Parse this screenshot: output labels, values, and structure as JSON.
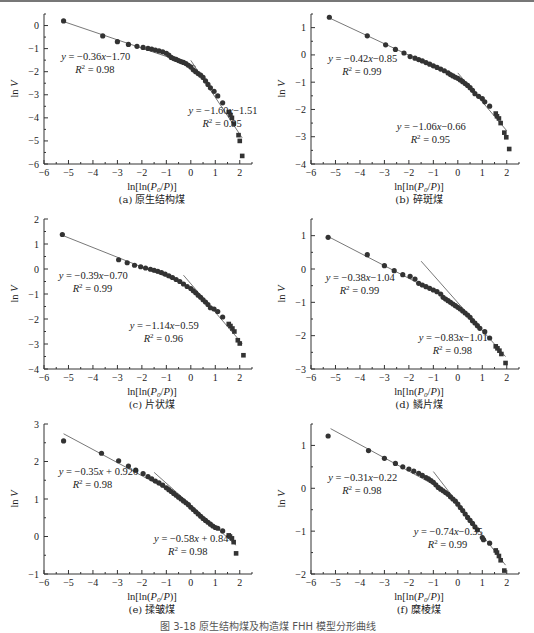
{
  "figure_caption": "图 3-18  原生结构煤及构造煤 FHH 模型分形曲线",
  "chart_data": [
    {
      "id": "a",
      "type": "scatter",
      "caption": "(a) 原生结构煤",
      "xlabel": "ln[ln(P0/P)]",
      "ylabel": "ln V",
      "xlim": [
        -6,
        2.5
      ],
      "ylim": [
        -6,
        0.5
      ],
      "xticks": [
        -6,
        -5,
        -4,
        -3,
        -2,
        -1,
        0,
        1,
        2
      ],
      "yticks": [
        -6,
        -5,
        -4,
        -3,
        -2,
        -1,
        0
      ],
      "fits": [
        {
          "equation": "y = −0.36x−1.70",
          "r2": "R² = 0.98",
          "slope": -0.36,
          "intercept": -1.7,
          "x_range": [
            -5.2,
            0.2
          ]
        },
        {
          "equation": "y = −1.60x−1.51",
          "r2": "R² = 0.95",
          "slope": -1.6,
          "intercept": -1.51,
          "x_range": [
            0.0,
            2.1
          ]
        }
      ],
      "points": [
        [
          -5.2,
          0.2
        ],
        [
          -3.6,
          -0.45
        ],
        [
          -3.0,
          -0.7
        ],
        [
          -2.55,
          -0.82
        ],
        [
          -2.2,
          -0.9
        ],
        [
          -1.95,
          -0.95
        ],
        [
          -1.75,
          -0.99
        ],
        [
          -1.6,
          -1.02
        ],
        [
          -1.45,
          -1.06
        ],
        [
          -1.3,
          -1.1
        ],
        [
          -1.15,
          -1.14
        ],
        [
          -1.0,
          -1.2
        ],
        [
          -0.9,
          -1.28
        ],
        [
          -0.8,
          -1.38
        ],
        [
          -0.7,
          -1.43
        ],
        [
          -0.6,
          -1.47
        ],
        [
          -0.5,
          -1.52
        ],
        [
          -0.4,
          -1.56
        ],
        [
          -0.3,
          -1.6
        ],
        [
          -0.2,
          -1.65
        ],
        [
          -0.1,
          -1.72
        ],
        [
          0.0,
          -1.8
        ],
        [
          0.1,
          -1.92
        ],
        [
          0.2,
          -2.0
        ],
        [
          0.3,
          -2.08
        ],
        [
          0.4,
          -2.15
        ],
        [
          0.5,
          -2.25
        ],
        [
          0.6,
          -2.4
        ],
        [
          0.7,
          -2.55
        ],
        [
          0.8,
          -2.7
        ],
        [
          0.95,
          -2.85
        ],
        [
          1.1,
          -3.05
        ],
        [
          1.3,
          -3.35
        ],
        [
          1.55,
          -3.75
        ],
        [
          1.62,
          -3.88
        ],
        [
          1.68,
          -4.0
        ],
        [
          1.75,
          -4.25
        ],
        [
          1.95,
          -4.75
        ],
        [
          2.0,
          -5.0
        ],
        [
          2.1,
          -5.65
        ]
      ],
      "annotations": [
        {
          "text_key": 0,
          "x": -5.3,
          "y": -1.5
        },
        {
          "text_key": 1,
          "x": -0.1,
          "y": -3.85
        }
      ]
    },
    {
      "id": "b",
      "type": "scatter",
      "caption": "(b) 碎斑煤",
      "xlabel": "ln[ln(P0/P)]",
      "ylabel": "ln V",
      "xlim": [
        -6,
        2.5
      ],
      "ylim": [
        -4,
        1.5
      ],
      "xticks": [
        -6,
        -5,
        -4,
        -3,
        -2,
        -1,
        0,
        1,
        2
      ],
      "yticks": [
        -4,
        -3,
        -2,
        -1,
        0,
        1
      ],
      "fits": [
        {
          "equation": "y = −0.42x−0.85",
          "r2": "R² = 0.99",
          "slope": -0.42,
          "intercept": -0.85,
          "x_range": [
            -5.2,
            0.0
          ]
        },
        {
          "equation": "y = −1.06x−0.66",
          "r2": "R² = 0.95",
          "slope": -1.06,
          "intercept": -0.66,
          "x_range": [
            0.0,
            2.0
          ]
        }
      ],
      "points": [
        [
          -5.25,
          1.38
        ],
        [
          -3.7,
          0.7
        ],
        [
          -2.95,
          0.37
        ],
        [
          -2.55,
          0.2
        ],
        [
          -2.2,
          0.07
        ],
        [
          -1.95,
          -0.06
        ],
        [
          -1.75,
          -0.12
        ],
        [
          -1.6,
          -0.17
        ],
        [
          -1.45,
          -0.22
        ],
        [
          -1.3,
          -0.28
        ],
        [
          -1.15,
          -0.34
        ],
        [
          -1.0,
          -0.4
        ],
        [
          -0.85,
          -0.46
        ],
        [
          -0.7,
          -0.52
        ],
        [
          -0.55,
          -0.58
        ],
        [
          -0.4,
          -0.66
        ],
        [
          -0.3,
          -0.72
        ],
        [
          -0.2,
          -0.77
        ],
        [
          -0.1,
          -0.82
        ],
        [
          0.0,
          -0.86
        ],
        [
          0.1,
          -0.92
        ],
        [
          0.2,
          -0.98
        ],
        [
          0.3,
          -1.05
        ],
        [
          0.4,
          -1.12
        ],
        [
          0.5,
          -1.2
        ],
        [
          0.6,
          -1.3
        ],
        [
          0.7,
          -1.42
        ],
        [
          0.85,
          -1.52
        ],
        [
          1.0,
          -1.6
        ],
        [
          1.1,
          -1.72
        ],
        [
          1.3,
          -1.88
        ],
        [
          1.55,
          -2.15
        ],
        [
          1.6,
          -2.25
        ],
        [
          1.68,
          -2.33
        ],
        [
          1.75,
          -2.5
        ],
        [
          1.9,
          -2.85
        ],
        [
          1.98,
          -3.02
        ],
        [
          2.1,
          -3.45
        ]
      ],
      "annotations": [
        {
          "text_key": 0,
          "x": -5.3,
          "y": -0.25
        },
        {
          "text_key": 1,
          "x": -2.5,
          "y": -2.75
        }
      ]
    },
    {
      "id": "c",
      "type": "scatter",
      "caption": "(c) 片状煤",
      "xlabel": "ln[ln(P0/P)]",
      "ylabel": "ln V",
      "xlim": [
        -6,
        2.5
      ],
      "ylim": [
        -4,
        2
      ],
      "xticks": [
        -6,
        -5,
        -4,
        -3,
        -2,
        -1,
        0,
        1,
        2
      ],
      "yticks": [
        -4,
        -3,
        -2,
        -1,
        0,
        1,
        2
      ],
      "fits": [
        {
          "equation": "y = −0.39x−0.70",
          "r2": "R² = 0.99",
          "slope": -0.39,
          "intercept": -0.7,
          "x_range": [
            -5.2,
            -0.5
          ]
        },
        {
          "equation": "y = −1.14x−0.59",
          "r2": "R² = 0.96",
          "slope": -1.14,
          "intercept": -0.59,
          "x_range": [
            -0.3,
            2.1
          ]
        }
      ],
      "points": [
        [
          -5.25,
          1.38
        ],
        [
          -2.95,
          0.37
        ],
        [
          -2.6,
          0.25
        ],
        [
          -2.3,
          0.15
        ],
        [
          -2.05,
          0.09
        ],
        [
          -1.85,
          0.04
        ],
        [
          -1.65,
          -0.01
        ],
        [
          -1.5,
          -0.05
        ],
        [
          -1.35,
          -0.09
        ],
        [
          -1.2,
          -0.14
        ],
        [
          -1.05,
          -0.2
        ],
        [
          -0.9,
          -0.27
        ],
        [
          -0.75,
          -0.34
        ],
        [
          -0.6,
          -0.42
        ],
        [
          -0.45,
          -0.5
        ],
        [
          -0.3,
          -0.6
        ],
        [
          -0.15,
          -0.7
        ],
        [
          0.0,
          -0.78
        ],
        [
          0.1,
          -0.87
        ],
        [
          0.2,
          -0.95
        ],
        [
          0.3,
          -1.05
        ],
        [
          0.4,
          -1.13
        ],
        [
          0.5,
          -1.23
        ],
        [
          0.6,
          -1.32
        ],
        [
          0.7,
          -1.42
        ],
        [
          0.8,
          -1.55
        ],
        [
          0.95,
          -1.6
        ],
        [
          1.1,
          -1.7
        ],
        [
          1.3,
          -1.92
        ],
        [
          1.55,
          -2.2
        ],
        [
          1.62,
          -2.28
        ],
        [
          1.7,
          -2.38
        ],
        [
          1.78,
          -2.5
        ],
        [
          1.92,
          -2.85
        ],
        [
          2.0,
          -2.98
        ],
        [
          2.15,
          -3.45
        ]
      ],
      "annotations": [
        {
          "text_key": 0,
          "x": -5.4,
          "y": -0.4
        },
        {
          "text_key": 1,
          "x": -2.5,
          "y": -2.4
        }
      ]
    },
    {
      "id": "d",
      "type": "scatter",
      "caption": "(d) 鳞片煤",
      "xlabel": "ln[ln(P0/P)]",
      "ylabel": "ln V",
      "xlim": [
        -6,
        2.5
      ],
      "ylim": [
        -3,
        1.5
      ],
      "xticks": [
        -6,
        -5,
        -4,
        -3,
        -2,
        -1,
        0,
        1,
        2
      ],
      "yticks": [
        -3,
        -2,
        -1,
        0,
        1
      ],
      "fits": [
        {
          "equation": "y = −0.38x−1.04",
          "r2": "R² = 0.99",
          "slope": -0.38,
          "intercept": -1.04,
          "x_range": [
            -5.3,
            -0.8
          ]
        },
        {
          "equation": "y = −0.83x−1.01",
          "r2": "R² = 0.98",
          "slope": -0.83,
          "intercept": -1.01,
          "x_range": [
            -1.5,
            1.95
          ]
        }
      ],
      "points": [
        [
          -5.3,
          0.95
        ],
        [
          -3.7,
          0.43
        ],
        [
          -3.0,
          0.1
        ],
        [
          -2.6,
          -0.05
        ],
        [
          -2.25,
          -0.17
        ],
        [
          -1.95,
          -0.22
        ],
        [
          -1.75,
          -0.3
        ],
        [
          -1.6,
          -0.43
        ],
        [
          -1.45,
          -0.48
        ],
        [
          -1.3,
          -0.53
        ],
        [
          -1.15,
          -0.58
        ],
        [
          -1.0,
          -0.63
        ],
        [
          -0.85,
          -0.68
        ],
        [
          -0.7,
          -0.75
        ],
        [
          -0.6,
          -0.85
        ],
        [
          -0.5,
          -0.9
        ],
        [
          -0.4,
          -0.95
        ],
        [
          -0.3,
          -1.0
        ],
        [
          -0.2,
          -1.05
        ],
        [
          -0.1,
          -1.1
        ],
        [
          0.0,
          -1.15
        ],
        [
          0.1,
          -1.2
        ],
        [
          0.2,
          -1.26
        ],
        [
          0.3,
          -1.32
        ],
        [
          0.4,
          -1.38
        ],
        [
          0.5,
          -1.45
        ],
        [
          0.6,
          -1.55
        ],
        [
          0.7,
          -1.62
        ],
        [
          0.8,
          -1.7
        ],
        [
          0.9,
          -1.78
        ],
        [
          1.1,
          -1.88
        ],
        [
          1.3,
          -2.07
        ],
        [
          1.55,
          -2.32
        ],
        [
          1.62,
          -2.38
        ],
        [
          1.7,
          -2.45
        ],
        [
          1.78,
          -2.55
        ],
        [
          1.95,
          -2.82
        ]
      ],
      "annotations": [
        {
          "text_key": 0,
          "x": -5.4,
          "y": -0.35
        },
        {
          "text_key": 1,
          "x": -1.6,
          "y": -2.15
        }
      ]
    },
    {
      "id": "e",
      "type": "scatter",
      "caption": "(e) 揉皱煤",
      "xlabel": "ln[ln(P0/P)]",
      "ylabel": "ln V",
      "xlim": [
        -6,
        2.5
      ],
      "ylim": [
        -1,
        3
      ],
      "xticks": [
        -6,
        -5,
        -4,
        -3,
        -2,
        -1,
        0,
        1,
        2
      ],
      "yticks": [
        -1,
        0,
        1,
        2,
        3
      ],
      "fits": [
        {
          "equation": "y = −0.35x + 0.920",
          "r2": "R² = 0.98",
          "slope": -0.35,
          "intercept": 0.92,
          "x_range": [
            -5.2,
            -1.0
          ]
        },
        {
          "equation": "y = −0.58x + 0.84",
          "r2": "R² = 0.98",
          "slope": -0.58,
          "intercept": 0.84,
          "x_range": [
            -1.5,
            1.85
          ]
        }
      ],
      "points": [
        [
          -5.2,
          2.55
        ],
        [
          -3.65,
          2.22
        ],
        [
          -2.95,
          2.02
        ],
        [
          -2.55,
          1.88
        ],
        [
          -2.25,
          1.77
        ],
        [
          -1.95,
          1.68
        ],
        [
          -1.75,
          1.6
        ],
        [
          -1.6,
          1.54
        ],
        [
          -1.45,
          1.48
        ],
        [
          -1.3,
          1.43
        ],
        [
          -1.15,
          1.37
        ],
        [
          -1.0,
          1.3
        ],
        [
          -0.9,
          1.25
        ],
        [
          -0.8,
          1.2
        ],
        [
          -0.7,
          1.15
        ],
        [
          -0.6,
          1.1
        ],
        [
          -0.5,
          1.05
        ],
        [
          -0.4,
          1.0
        ],
        [
          -0.3,
          0.95
        ],
        [
          -0.2,
          0.9
        ],
        [
          -0.1,
          0.85
        ],
        [
          0.0,
          0.78
        ],
        [
          0.1,
          0.72
        ],
        [
          0.2,
          0.66
        ],
        [
          0.3,
          0.6
        ],
        [
          0.4,
          0.54
        ],
        [
          0.5,
          0.48
        ],
        [
          0.6,
          0.43
        ],
        [
          0.7,
          0.38
        ],
        [
          0.8,
          0.33
        ],
        [
          0.9,
          0.28
        ],
        [
          1.0,
          0.24
        ],
        [
          1.1,
          0.22
        ],
        [
          1.3,
          0.15
        ],
        [
          1.55,
          0.03
        ],
        [
          1.6,
          0.0
        ],
        [
          1.68,
          -0.05
        ],
        [
          1.75,
          -0.15
        ],
        [
          1.85,
          -0.45
        ]
      ],
      "annotations": [
        {
          "text_key": 0,
          "x": -5.4,
          "y": 1.65
        },
        {
          "text_key": 1,
          "x": -1.5,
          "y": -0.15
        }
      ]
    },
    {
      "id": "f",
      "type": "scatter",
      "caption": "(f) 糜棱煤",
      "xlabel": "ln[ln(P0/P)]",
      "ylabel": "ln V",
      "xlim": [
        -6,
        2.5
      ],
      "ylim": [
        -2,
        1.5
      ],
      "xticks": [
        -6,
        -5,
        -4,
        -3,
        -2,
        -1,
        0,
        1,
        2
      ],
      "yticks": [
        -2,
        -1,
        0,
        1
      ],
      "fits": [
        {
          "equation": "y = −0.31x−0.22",
          "r2": "R² = 0.98",
          "slope": -0.31,
          "intercept": -0.22,
          "x_range": [
            -5.2,
            -0.8
          ]
        },
        {
          "equation": "y = −0.74x−0.35",
          "r2": "R² = 0.99",
          "slope": -0.74,
          "intercept": -0.35,
          "x_range": [
            -1.0,
            1.95
          ]
        }
      ],
      "points": [
        [
          -5.3,
          1.22
        ],
        [
          -3.65,
          0.88
        ],
        [
          -3.0,
          0.7
        ],
        [
          -2.55,
          0.58
        ],
        [
          -2.25,
          0.5
        ],
        [
          -2.0,
          0.45
        ],
        [
          -1.8,
          0.4
        ],
        [
          -1.6,
          0.35
        ],
        [
          -1.45,
          0.3
        ],
        [
          -1.3,
          0.25
        ],
        [
          -1.2,
          0.22
        ],
        [
          -1.1,
          0.18
        ],
        [
          -1.0,
          0.14
        ],
        [
          -0.9,
          0.08
        ],
        [
          -0.8,
          0.02
        ],
        [
          -0.7,
          -0.02
        ],
        [
          -0.6,
          -0.06
        ],
        [
          -0.5,
          -0.1
        ],
        [
          -0.4,
          -0.14
        ],
        [
          -0.3,
          -0.2
        ],
        [
          -0.2,
          -0.25
        ],
        [
          -0.1,
          -0.3
        ],
        [
          0.0,
          -0.37
        ],
        [
          0.1,
          -0.45
        ],
        [
          0.2,
          -0.52
        ],
        [
          0.3,
          -0.6
        ],
        [
          0.4,
          -0.68
        ],
        [
          0.5,
          -0.75
        ],
        [
          0.6,
          -0.82
        ],
        [
          0.7,
          -0.9
        ],
        [
          0.8,
          -0.97
        ],
        [
          1.0,
          -1.15
        ],
        [
          1.05,
          -1.2
        ],
        [
          1.3,
          -1.28
        ],
        [
          1.55,
          -1.45
        ],
        [
          1.6,
          -1.5
        ],
        [
          1.68,
          -1.58
        ],
        [
          1.75,
          -1.68
        ],
        [
          1.9,
          -1.92
        ]
      ],
      "annotations": [
        {
          "text_key": 0,
          "x": -5.3,
          "y": 0.18
        },
        {
          "text_key": 1,
          "x": -1.8,
          "y": -1.1
        }
      ]
    }
  ]
}
